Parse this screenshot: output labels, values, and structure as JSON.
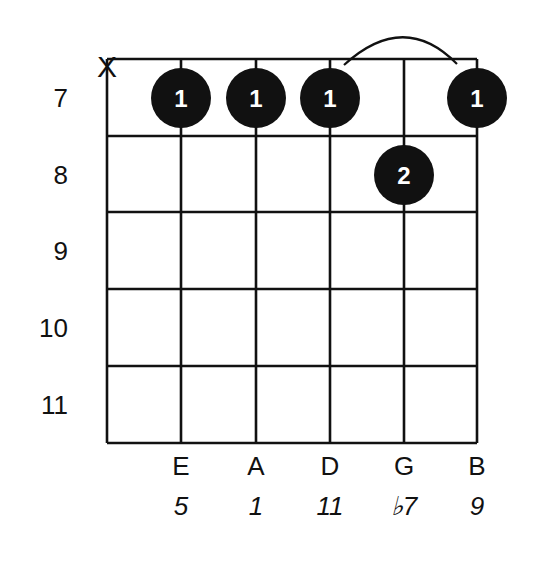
{
  "diagram": {
    "type": "guitar-chord-diagram",
    "colors": {
      "ink": "#111111",
      "background": "#ffffff",
      "dot_text": "#ffffff"
    },
    "frets": [
      "7",
      "8",
      "9",
      "10",
      "11"
    ],
    "muted_marker": "X",
    "strings": [
      {
        "index": 1,
        "name": "",
        "interval": "",
        "muted": true
      },
      {
        "index": 2,
        "name": "E",
        "interval": "5"
      },
      {
        "index": 3,
        "name": "A",
        "interval": "1"
      },
      {
        "index": 4,
        "name": "D",
        "interval": "11"
      },
      {
        "index": 5,
        "name": "G",
        "interval": "♭7"
      },
      {
        "index": 6,
        "name": "B",
        "interval": "9"
      }
    ],
    "fingerings": [
      {
        "string": 2,
        "fret": "7",
        "finger": "1"
      },
      {
        "string": 3,
        "fret": "7",
        "finger": "1"
      },
      {
        "string": 4,
        "fret": "7",
        "finger": "1"
      },
      {
        "string": 5,
        "fret": "8",
        "finger": "2"
      },
      {
        "string": 6,
        "fret": "7",
        "finger": "1"
      }
    ],
    "slur": {
      "from_string": 4,
      "to_string": 6
    }
  }
}
